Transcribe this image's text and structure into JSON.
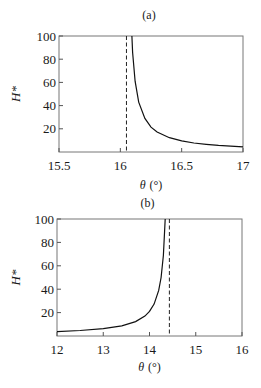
{
  "chart_data": [
    {
      "type": "line",
      "panel_label": "(a)",
      "title": "",
      "xlabel": "θ (°)",
      "xlabel_symbol": "θ",
      "xlabel_unit": "(°)",
      "ylabel": "H*",
      "xlim": [
        15.5,
        17
      ],
      "ylim": [
        0,
        100
      ],
      "xticks": [
        15.5,
        16,
        16.5,
        17
      ],
      "xtick_labels": [
        "15.5",
        "16",
        "16.5",
        "17"
      ],
      "yticks": [
        20,
        40,
        60,
        80,
        100
      ],
      "ytick_labels": [
        "20",
        "40",
        "60",
        "80",
        "100"
      ],
      "grid": false,
      "asymptote": {
        "x": 16.05,
        "style": "dashed"
      },
      "series": [
        {
          "name": "H*",
          "x": [
            16.094,
            16.1,
            16.12,
            16.15,
            16.2,
            16.25,
            16.3,
            16.4,
            16.5,
            16.6,
            16.7,
            16.8,
            16.9,
            17.0
          ],
          "y": [
            100,
            86,
            61,
            43,
            29,
            21.5,
            17.2,
            12.3,
            9.6,
            7.8,
            6.6,
            5.7,
            5.1,
            4.5
          ]
        }
      ]
    },
    {
      "type": "line",
      "panel_label": "(b)",
      "title": "",
      "xlabel": "θ (°)",
      "xlabel_symbol": "θ",
      "xlabel_unit": "(°)",
      "ylabel": "H*",
      "xlim": [
        12,
        16
      ],
      "ylim": [
        0,
        100
      ],
      "xticks": [
        12,
        13,
        14,
        15,
        16
      ],
      "xtick_labels": [
        "12",
        "13",
        "14",
        "15",
        "16"
      ],
      "yticks": [
        20,
        40,
        60,
        80,
        100
      ],
      "ytick_labels": [
        "20",
        "40",
        "60",
        "80",
        "100"
      ],
      "grid": false,
      "asymptote": {
        "x": 14.43,
        "style": "dashed"
      },
      "series": [
        {
          "name": "H*",
          "x": [
            12.0,
            12.5,
            13.0,
            13.4,
            13.7,
            13.9,
            14.0,
            14.1,
            14.2,
            14.25,
            14.3,
            14.34
          ],
          "y": [
            3.7,
            4.7,
            6.3,
            8.7,
            12.3,
            17,
            21,
            27.3,
            39,
            50,
            69,
            100
          ]
        }
      ]
    }
  ]
}
